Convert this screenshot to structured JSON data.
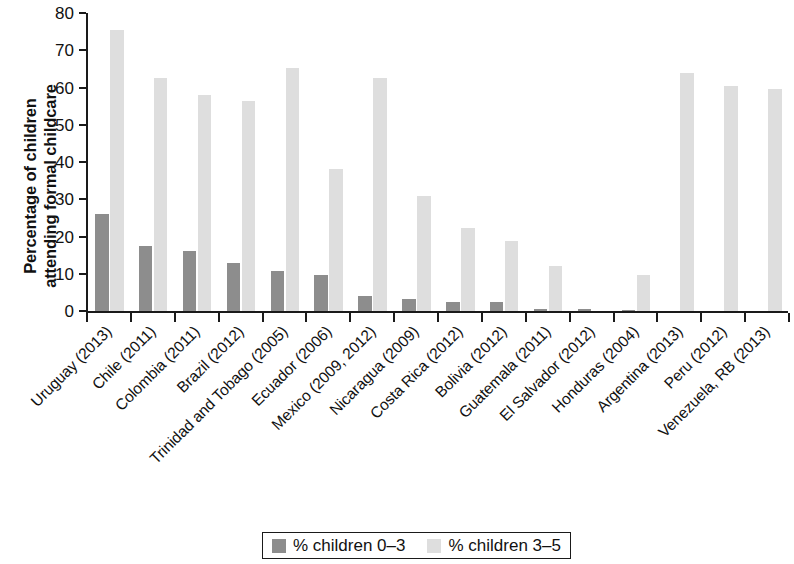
{
  "chart_data": {
    "type": "bar",
    "title": "",
    "xlabel": "",
    "ylabel": "Percentage of children\nattending formal childcare",
    "ylim": [
      0,
      80
    ],
    "yticks": [
      0,
      10,
      20,
      30,
      40,
      50,
      60,
      70,
      80
    ],
    "grid": false,
    "legend_position": "bottom",
    "categories": [
      "Uruguay (2013)",
      "Chile (2011)",
      "Colombia (2011)",
      "Brazil (2012)",
      "Trinidad and Tobago (2005)",
      "Ecuador (2006)",
      "Mexico (2009, 2012)",
      "Nicaragua (2009)",
      "Costa Rica (2012)",
      "Bolivia (2012)",
      "Guatemala (2011)",
      "El Salvador (2012)",
      "Honduras (2004)",
      "Argentina (2013)",
      "Peru (2012)",
      "Venezuela, RB (2013)"
    ],
    "series": [
      {
        "name": "% children 0–3",
        "color": "#8d8d8d",
        "values": [
          26.0,
          17.5,
          16.2,
          13.0,
          10.8,
          9.8,
          4.0,
          3.2,
          2.5,
          2.3,
          0.5,
          0.6,
          0.4,
          0,
          0,
          0
        ]
      },
      {
        "name": "% children 3–5",
        "color": "#dedede",
        "values": [
          75.5,
          62.5,
          58.0,
          56.3,
          65.3,
          38.0,
          62.5,
          30.8,
          22.3,
          18.7,
          12.2,
          0,
          9.8,
          64.0,
          60.3,
          59.5
        ]
      }
    ]
  },
  "legend": {
    "items": [
      {
        "label": "% children 0–3",
        "swatch": "#8d8d8d"
      },
      {
        "label": "% children 3–5",
        "swatch": "#dedede"
      }
    ]
  }
}
